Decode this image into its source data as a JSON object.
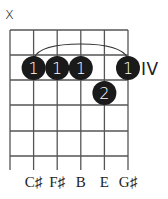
{
  "chord_diagram": {
    "strings": 6,
    "frets_shown": 5,
    "position_label": "IV",
    "muted_strings": [
      {
        "string": 1,
        "symbol": "x"
      }
    ],
    "barre": {
      "finger": "1",
      "from_string": 2,
      "to_string": 6,
      "fret": 2
    },
    "fingers": [
      {
        "string": 2,
        "fret": 2,
        "label": "1"
      },
      {
        "string": 3,
        "fret": 2,
        "label": "1"
      },
      {
        "string": 4,
        "fret": 2,
        "label": "1"
      },
      {
        "string": 6,
        "fret": 2,
        "label": "1"
      },
      {
        "string": 5,
        "fret": 3,
        "label": "2"
      }
    ],
    "note_names": [
      "",
      "C♯",
      "F♯",
      "B",
      "E",
      "G♯"
    ],
    "colors": {
      "line": "#555555",
      "dot": "#1a1a1a",
      "dot_text": "#ffffff",
      "text": "#222222"
    }
  }
}
